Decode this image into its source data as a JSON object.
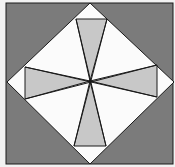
{
  "diagram": {
    "colors": {
      "background": "#f2f2f2",
      "outer_fill": "#7b7b7b",
      "diamond_fill": "#fbfbfb",
      "shaded_fill": "#c8c8c8",
      "stroke": "#1a1a1a"
    },
    "outer_square": {
      "x": 6,
      "y": 3,
      "width": 167,
      "height": 161
    },
    "diamond": {
      "points": "90,3 174,82 90,164 7,82"
    },
    "center": {
      "x": 90,
      "y": 81
    },
    "shaded_triangles": [
      {
        "name": "top",
        "points": "76,19 107,19 90,81"
      },
      {
        "name": "left",
        "points": "25,67 25,99 90,81"
      },
      {
        "name": "right",
        "points": "157,65 157,97 90,81"
      },
      {
        "name": "bottom",
        "points": "74,146 106,146 90,81"
      }
    ],
    "lines": [
      {
        "x1": 76,
        "y1": 19,
        "x2": 106,
        "y2": 146
      },
      {
        "x1": 107,
        "y1": 19,
        "x2": 74,
        "y2": 146
      },
      {
        "x1": 25,
        "y1": 67,
        "x2": 157,
        "y2": 97
      },
      {
        "x1": 25,
        "y1": 99,
        "x2": 157,
        "y2": 65
      }
    ]
  }
}
